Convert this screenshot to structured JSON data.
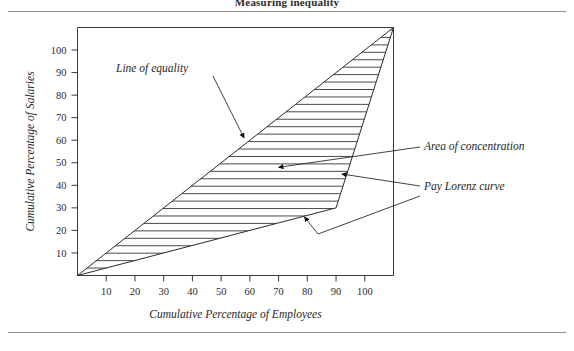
{
  "document": {
    "running_title": "Measuring inequality",
    "rules": {
      "top_label": "top-divider",
      "bottom_label": "bottom-divider"
    }
  },
  "chart_data": {
    "type": "line",
    "title": "Measuring inequality",
    "xlabel": "Cumulative Percentage of Employees",
    "ylabel": "Cumulative Percentage of Salaries",
    "xlim": [
      0,
      110
    ],
    "ylim": [
      0,
      110
    ],
    "xticks": [
      10,
      20,
      30,
      40,
      50,
      60,
      70,
      80,
      90,
      100
    ],
    "yticks": [
      10,
      20,
      30,
      40,
      50,
      60,
      70,
      80,
      90,
      100
    ],
    "xtick_labels": [
      "10",
      "20",
      "30",
      "40",
      "50",
      "60",
      "70",
      "80",
      "90",
      "100"
    ],
    "ytick_labels": [
      "10",
      "20",
      "30",
      "40",
      "50",
      "60",
      "70",
      "80",
      "90",
      "100"
    ],
    "grid": false,
    "legend": "none",
    "series": [
      {
        "name": "Line of equality",
        "type": "line",
        "x": [
          0,
          110
        ],
        "y": [
          0,
          110
        ]
      },
      {
        "name": "Pay Lorenz curve",
        "type": "line",
        "x": [
          0,
          90,
          110
        ],
        "y": [
          0,
          30,
          110
        ]
      }
    ],
    "shaded_region": {
      "name": "Area of concentration",
      "pattern": "horizontal-hatch",
      "between": [
        "Line of equality",
        "Pay Lorenz curve"
      ],
      "hatch_spacing_pct": 3.3
    },
    "annotations": [
      {
        "id": "line-of-equality",
        "text": "Line of equality",
        "points_to_x": 58,
        "points_to_y": 61
      },
      {
        "id": "area-of-concentration",
        "text": "Area of concentration",
        "points_to_x": 70,
        "points_to_y": 48
      },
      {
        "id": "pay-lorenz-curve",
        "text": "Pay Lorenz curve",
        "points_to_x": 92,
        "points_to_y": 45
      },
      {
        "id": "pay-lorenz-curve-lower",
        "text": "",
        "points_to_x": 79,
        "points_to_y": 26
      }
    ]
  },
  "labels": {
    "line_of_equality": "Line of equality",
    "area_of_concentration": "Area of concentration",
    "pay_lorenz_curve": "Pay Lorenz curve",
    "x_axis_title": "Cumulative Percentage of Employees",
    "y_axis_title": "Cumulative Percentage of Salaries"
  }
}
